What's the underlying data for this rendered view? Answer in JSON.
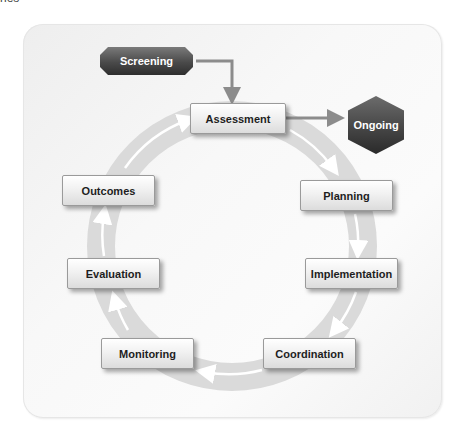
{
  "clipped_caption": "nes",
  "diagram": {
    "entry": {
      "label": "Screening"
    },
    "exit": {
      "label": "Ongoing"
    },
    "cycle": [
      {
        "label": "Assessment"
      },
      {
        "label": "Planning"
      },
      {
        "label": "Implementation"
      },
      {
        "label": "Coordination"
      },
      {
        "label": "Monitoring"
      },
      {
        "label": "Evaluation"
      },
      {
        "label": "Outcomes"
      }
    ],
    "colors": {
      "ring": "#d9d9d9",
      "arrow": "#8c8c8c",
      "dark_node": "#4a4a4a",
      "card_bg": "#f5f5f5"
    }
  }
}
